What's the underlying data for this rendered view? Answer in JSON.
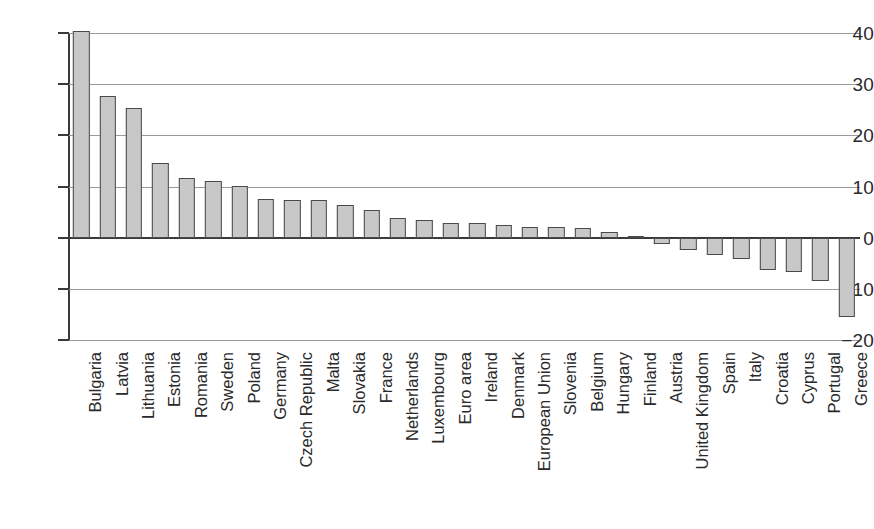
{
  "chart_data": {
    "type": "bar",
    "title": "",
    "subtitle": "",
    "xlabel": "",
    "ylabel": "",
    "ylim": [
      -20,
      40
    ],
    "yticks": [
      40,
      30,
      20,
      10,
      0,
      -10,
      -20
    ],
    "ytick_labels": [
      "40",
      "30",
      "20",
      "10",
      "0",
      "−10",
      "−20"
    ],
    "grid": true,
    "legend": "none",
    "orientation": "vertical",
    "bar_fill": "#c8c8c8",
    "bar_edge": "#4a4a4a",
    "categories": [
      "Bulgaria",
      "Latvia",
      "Lithuania",
      "Estonia",
      "Romania",
      "Sweden",
      "Poland",
      "Germany",
      "Czech Republic",
      "Malta",
      "Slovakia",
      "France",
      "Netherlands",
      "Luxembourg",
      "Euro area",
      "Ireland",
      "Denmark",
      "European Union",
      "Slovenia",
      "Belgium",
      "Hungary",
      "Finland",
      "Austria",
      "United Kingdom",
      "Spain",
      "Italy",
      "Croatia",
      "Cyprus",
      "Portugal",
      "Greece"
    ],
    "values": [
      40.3,
      27.6,
      25.4,
      14.5,
      11.7,
      11.1,
      10.1,
      7.6,
      7.4,
      7.3,
      6.4,
      5.4,
      3.8,
      3.5,
      2.9,
      2.8,
      2.4,
      2.1,
      2.0,
      1.9,
      1.1,
      0.3,
      -1.2,
      -2.4,
      -3.3,
      -4.2,
      -6.4,
      -6.8,
      -8.5,
      -15.5
    ]
  },
  "caption": {
    "text": ""
  }
}
